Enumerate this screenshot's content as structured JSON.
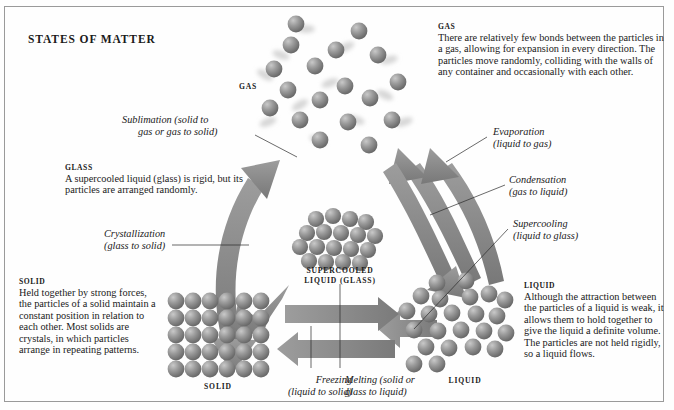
{
  "title": "STATES OF MATTER",
  "state_labels": {
    "gas": "GAS",
    "supercooled_line1": "SUPERCOOLED",
    "supercooled_line2": "LIQUID (GLASS)",
    "solid": "SOLID",
    "liquid": "LIQUID"
  },
  "descriptions": {
    "gas": {
      "heading": "GAS",
      "body": "There are relatively few bonds between the particles in a gas, allowing for expansion in every direction. The particles move randomly, colliding with the walls of any container and occasionally with each other."
    },
    "glass": {
      "heading": "GLASS",
      "body": "A supercooled liquid (glass) is rigid, but its particles are arranged randomly."
    },
    "solid": {
      "heading": "SOLID",
      "body": "Held together by strong forces, the particles of a solid maintain a constant position in relation to each other. Most solids are crystals, in which particles arrange in repeating patterns."
    },
    "liquid": {
      "heading": "LIQUID",
      "body": "Although the attraction between the particles of a liquid is weak, it allows them to hold together to give the liquid a definite volume. The particles are not held rigidly, so a liquid flows."
    }
  },
  "transitions": {
    "sublimation_l1": "Sublimation (solid to",
    "sublimation_l2": "gas or gas to solid)",
    "crystallization_l1": "Crystallization",
    "crystallization_l2": "(glass to solid)",
    "evaporation_l1": "Evaporation",
    "evaporation_l2": "(liquid to gas)",
    "condensation_l1": "Condensation",
    "condensation_l2": "(gas to liquid)",
    "supercooling_l1": "Supercooling",
    "supercooling_l2": "(liquid to glass)",
    "freezing_l1": "Freezing",
    "freezing_l2": "(liquid to solid)",
    "melting_l1": "Melting (solid or",
    "melting_l2": "glass to liquid)"
  },
  "colors": {
    "arrow": "#8c8c8c",
    "particle": "#7d7d7d",
    "border": "#9a9a9a",
    "text": "#1a1a1a"
  }
}
